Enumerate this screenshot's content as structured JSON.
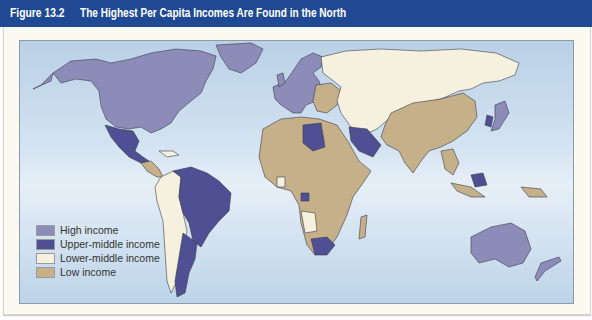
{
  "figure": {
    "number": "Figure 13.2",
    "title": "The Highest Per Capita Incomes Are Found in the North"
  },
  "colors": {
    "title_bar": "#1f4a93",
    "ocean": "#d3e3f1",
    "card_background": "#fbfaf0",
    "high_income": "#8d8cb8",
    "upper_middle_income": "#4f4f93",
    "lower_middle_income": "#f6f1df",
    "low_income": "#c5b08a"
  },
  "legend": {
    "items": [
      {
        "label": "High income",
        "color": "#8d8cb8"
      },
      {
        "label": "Upper-middle income",
        "color": "#4f4f93"
      },
      {
        "label": "Lower-middle income",
        "color": "#f6f1df"
      },
      {
        "label": "Low income",
        "color": "#c5b08a"
      }
    ]
  },
  "map": {
    "type": "choropleth world map",
    "regions": [
      {
        "name": "North America (USA, Canada)",
        "category": "High income"
      },
      {
        "name": "Greenland",
        "category": "High income"
      },
      {
        "name": "Mexico",
        "category": "Upper-middle income"
      },
      {
        "name": "Central America",
        "category": "Low income"
      },
      {
        "name": "Brazil / Venezuela",
        "category": "Upper-middle income"
      },
      {
        "name": "Argentina / Chile",
        "category": "Upper-middle income"
      },
      {
        "name": "Andean countries",
        "category": "Lower-middle income"
      },
      {
        "name": "Western Europe",
        "category": "High income"
      },
      {
        "name": "Eastern Europe",
        "category": "Low income"
      },
      {
        "name": "Russia / Central Asia",
        "category": "Lower-middle income"
      },
      {
        "name": "China / South Asia",
        "category": "Low income"
      },
      {
        "name": "Japan",
        "category": "High income"
      },
      {
        "name": "South Korea",
        "category": "Upper-middle income"
      },
      {
        "name": "Africa",
        "category": "Low income"
      },
      {
        "name": "Libya",
        "category": "Upper-middle income"
      },
      {
        "name": "Saudi Arabia",
        "category": "Upper-middle income"
      },
      {
        "name": "South Africa",
        "category": "Upper-middle income"
      },
      {
        "name": "Australia / New Zealand",
        "category": "High income"
      }
    ]
  }
}
